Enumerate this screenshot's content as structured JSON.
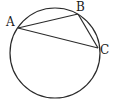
{
  "diagram": {
    "type": "circle-inscribed-triangle",
    "circle": {
      "cx": 55,
      "cy": 53,
      "r": 45
    },
    "points": [
      {
        "label": "A",
        "x": 18,
        "y": 28,
        "lx": 6,
        "ly": 26
      },
      {
        "label": "B",
        "x": 78,
        "y": 14,
        "lx": 76,
        "ly": 11
      },
      {
        "label": "C",
        "x": 98,
        "y": 48,
        "lx": 100,
        "ly": 54
      }
    ],
    "segments": [
      [
        "A",
        "B"
      ],
      [
        "B",
        "C"
      ],
      [
        "A",
        "C"
      ]
    ],
    "stroke_color": "#2a2a2a"
  }
}
